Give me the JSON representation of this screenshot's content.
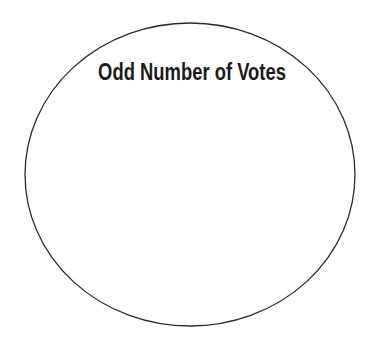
{
  "diagram": {
    "type": "venn-set",
    "title": "Odd Number of Votes",
    "shapes": [
      {
        "kind": "ellipse",
        "label": "Odd Number of Votes",
        "cx": 190,
        "cy": 174.5,
        "rx": 165,
        "ry": 151.5,
        "stroke": "#2a2a2a",
        "fill": "#ffffff"
      }
    ]
  }
}
